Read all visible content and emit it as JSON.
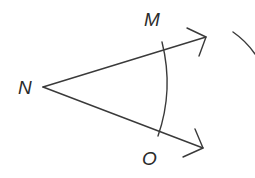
{
  "diagram": {
    "type": "angle-construction",
    "colors": {
      "background": "#ffffff",
      "stroke": "#3a3a3a",
      "label": "#2b2b2b"
    },
    "points": [
      {
        "id": "N",
        "label": "N",
        "role": "vertex"
      },
      {
        "id": "M",
        "label": "M",
        "role": "point-on-ray"
      },
      {
        "id": "O",
        "label": "O",
        "role": "point-on-ray"
      }
    ],
    "rays": [
      {
        "id": "ray-NM",
        "from": "N",
        "through": "M",
        "arrow": true
      },
      {
        "id": "ray-NO",
        "from": "N",
        "through": "O",
        "arrow": true
      }
    ],
    "arcs": [
      {
        "id": "arc-center-N",
        "center": "N",
        "intersects": [
          "ray-NM",
          "ray-NO"
        ]
      },
      {
        "id": "partial-arc-right",
        "note": "partial construction arc at right edge"
      }
    ]
  }
}
